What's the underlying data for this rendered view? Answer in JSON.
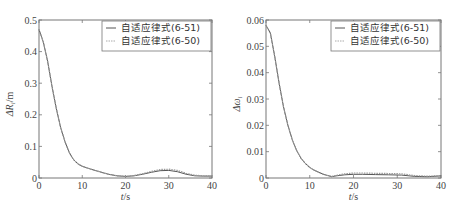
{
  "chart_data": [
    {
      "type": "line",
      "title": "",
      "xlabel": "t/s",
      "ylabel": "ΔR_i/m",
      "xlim": [
        0,
        40
      ],
      "ylim": [
        0,
        0.5
      ],
      "xticks": [
        "0",
        "10",
        "20",
        "30",
        "40"
      ],
      "yticks": [
        "0",
        "0.1",
        "0.2",
        "0.3",
        "0.4",
        "0.5"
      ],
      "grid": false,
      "legend_position": "upper right",
      "x": [
        0,
        1,
        2,
        3,
        4,
        5,
        6,
        7,
        8,
        9,
        10,
        12,
        14,
        16,
        18,
        20,
        22,
        24,
        26,
        28,
        30,
        32,
        34,
        36,
        38,
        40
      ],
      "series": [
        {
          "name": "自适应律式(6-51)",
          "style": "solid",
          "values": [
            0.47,
            0.43,
            0.37,
            0.29,
            0.22,
            0.16,
            0.115,
            0.08,
            0.058,
            0.045,
            0.037,
            0.028,
            0.02,
            0.012,
            0.007,
            0.005,
            0.007,
            0.012,
            0.018,
            0.023,
            0.024,
            0.02,
            0.012,
            0.007,
            0.006,
            0.006
          ]
        },
        {
          "name": "自适应律式(6-50)",
          "style": "dotted",
          "values": [
            0.47,
            0.43,
            0.37,
            0.29,
            0.22,
            0.16,
            0.115,
            0.08,
            0.058,
            0.045,
            0.037,
            0.028,
            0.02,
            0.012,
            0.007,
            0.005,
            0.008,
            0.014,
            0.021,
            0.027,
            0.028,
            0.024,
            0.015,
            0.009,
            0.007,
            0.007
          ]
        }
      ]
    },
    {
      "type": "line",
      "title": "",
      "xlabel": "t/s",
      "ylabel": "Δω_i",
      "xlim": [
        0,
        40
      ],
      "ylim": [
        0,
        0.06
      ],
      "xticks": [
        "0",
        "10",
        "20",
        "30",
        "40"
      ],
      "yticks": [
        "0",
        "0.01",
        "0.02",
        "0.03",
        "0.04",
        "0.05",
        "0.06"
      ],
      "grid": false,
      "legend_position": "upper right",
      "x": [
        0,
        1,
        2,
        3,
        4,
        5,
        6,
        7,
        8,
        9,
        10,
        11,
        12,
        13,
        14,
        15,
        16,
        18,
        20,
        22,
        25,
        28,
        31,
        34,
        37,
        40
      ],
      "series": [
        {
          "name": "自适应律式(6-51)",
          "style": "solid",
          "values": [
            0.058,
            0.055,
            0.046,
            0.036,
            0.027,
            0.02,
            0.0145,
            0.0105,
            0.0075,
            0.0055,
            0.004,
            0.003,
            0.0022,
            0.0015,
            0.001,
            0.0005,
            0.0008,
            0.0012,
            0.0014,
            0.0014,
            0.0013,
            0.0012,
            0.0011,
            0.0006,
            0.0005,
            0.0008
          ]
        },
        {
          "name": "自适应律式(6-50)",
          "style": "dotted",
          "values": [
            0.058,
            0.055,
            0.046,
            0.036,
            0.027,
            0.02,
            0.0145,
            0.0105,
            0.0075,
            0.0055,
            0.004,
            0.003,
            0.0022,
            0.0015,
            0.001,
            0.0006,
            0.001,
            0.0016,
            0.0019,
            0.0019,
            0.0018,
            0.0017,
            0.0016,
            0.0009,
            0.0007,
            0.0009
          ]
        }
      ]
    }
  ],
  "labels": {
    "left_ylabel_main": "ΔR",
    "left_ylabel_sub": "i",
    "left_ylabel_unit": "/m",
    "right_ylabel_main": "Δω",
    "right_ylabel_sub": "i",
    "xlabel_var": "t",
    "xlabel_unit": "/s"
  }
}
